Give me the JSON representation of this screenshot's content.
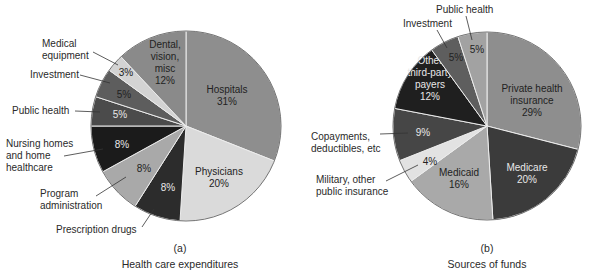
{
  "chart_data": [
    {
      "type": "pie",
      "panel": "(a)",
      "title": "Health care expenditures",
      "center": [
        186,
        126
      ],
      "radius": 95,
      "start_angle_deg": 0,
      "direction": "clockwise",
      "slices": [
        {
          "label": "Hospitals",
          "value": 31,
          "pct_label": "31%",
          "color": "#8e8e8e",
          "inside_text": [
            "Hospitals",
            "31%"
          ],
          "text_color": "dark"
        },
        {
          "label": "Physicians",
          "value": 20,
          "pct_label": "20%",
          "color": "#dadada",
          "inside_text": [
            "Physicians",
            "20%"
          ],
          "text_color": "dark"
        },
        {
          "label": "Prescription drugs",
          "value": 8,
          "pct_label": "8%",
          "color": "#2c2c2c",
          "inside_text": [
            "8%"
          ],
          "text_color": "light"
        },
        {
          "label": "Program administration",
          "value": 8,
          "pct_label": "8%",
          "color": "#a9a9a9",
          "inside_text": [
            "8%"
          ],
          "text_color": "dark"
        },
        {
          "label": "Nursing homes and home healthcare",
          "value": 8,
          "pct_label": "8%",
          "color": "#1b1b1b",
          "inside_text": [
            "8%"
          ],
          "text_color": "light"
        },
        {
          "label": "Public health",
          "value": 5,
          "pct_label": "5%",
          "color": "#4b4b4b",
          "inside_text": [
            "5%"
          ],
          "text_color": "light"
        },
        {
          "label": "Investment",
          "value": 5,
          "pct_label": "5%",
          "color": "#5d5d5d",
          "inside_text": [
            "5%"
          ],
          "text_color": "dark"
        },
        {
          "label": "Medical equipment",
          "value": 3,
          "pct_label": "3%",
          "color": "#d3d3d3",
          "inside_text": [
            "3%"
          ],
          "text_color": "dark"
        },
        {
          "label": "Dental, vision, misc",
          "value": 12,
          "pct_label": "12%",
          "color": "#8a8a8a",
          "inside_text": [
            "Dental,",
            "vision,",
            "misc",
            "12%"
          ],
          "text_color": "dark"
        }
      ],
      "external_labels": [
        {
          "slice": "Medical equipment",
          "lines": [
            "Medical",
            "equipment"
          ]
        },
        {
          "slice": "Investment",
          "lines": [
            "Investment"
          ]
        },
        {
          "slice": "Public health",
          "lines": [
            "Public health"
          ]
        },
        {
          "slice": "Nursing homes and home healthcare",
          "lines": [
            "Nursing homes",
            "and home",
            "healthcare"
          ]
        },
        {
          "slice": "Program administration",
          "lines": [
            "Program",
            "administration"
          ]
        },
        {
          "slice": "Prescription drugs",
          "lines": [
            "Prescription drugs"
          ]
        }
      ]
    },
    {
      "type": "pie",
      "panel": "(b)",
      "title": "Sources of funds",
      "center": [
        487,
        126
      ],
      "radius": 94,
      "start_angle_deg": 0,
      "direction": "clockwise",
      "slices": [
        {
          "label": "Private health insurance",
          "value": 29,
          "pct_label": "29%",
          "color": "#8e8e8e",
          "inside_text": [
            "Private health",
            "insurance",
            "29%"
          ],
          "text_color": "dark"
        },
        {
          "label": "Medicare",
          "value": 20,
          "pct_label": "20%",
          "color": "#3b3b3b",
          "inside_text": [
            "Medicare",
            "20%"
          ],
          "text_color": "light"
        },
        {
          "label": "Medicaid",
          "value": 16,
          "pct_label": "16%",
          "color": "#a9a9a9",
          "inside_text": [
            "Medicaid",
            "16%"
          ],
          "text_color": "dark"
        },
        {
          "label": "Military, other public insurance",
          "value": 4,
          "pct_label": "4%",
          "color": "#e2e2e2",
          "inside_text": [
            "4%"
          ],
          "text_color": "dark"
        },
        {
          "label": "Copayments, deductibles, etc",
          "value": 9,
          "pct_label": "9%",
          "color": "#464646",
          "inside_text": [
            "9%"
          ],
          "text_color": "light"
        },
        {
          "label": "Other third-party payers",
          "value": 12,
          "pct_label": "12%",
          "color": "#1f1f1f",
          "inside_text": [
            "Other",
            "third-party",
            "payers",
            "12%"
          ],
          "text_color": "light"
        },
        {
          "label": "Investment",
          "value": 5,
          "pct_label": "5%",
          "color": "#5e5e5e",
          "inside_text": [
            "5%"
          ],
          "text_color": "dark"
        },
        {
          "label": "Public health",
          "value": 5,
          "pct_label": "5%",
          "color": "#a2a2a2",
          "inside_text": [
            "5%"
          ],
          "text_color": "dark"
        }
      ],
      "external_labels": [
        {
          "slice": "Public health",
          "lines": [
            "Public health"
          ]
        },
        {
          "slice": "Investment",
          "lines": [
            "Investment"
          ]
        },
        {
          "slice": "Copayments, deductibles, etc",
          "lines": [
            "Copayments,",
            "deductibles, etc"
          ]
        },
        {
          "slice": "Military, other public insurance",
          "lines": [
            "Military, other",
            "public insurance"
          ]
        }
      ]
    }
  ],
  "captions": {
    "a": {
      "panel": "(a)",
      "title": "Health care expenditures"
    },
    "b": {
      "panel": "(b)",
      "title": "Sources of funds"
    }
  }
}
